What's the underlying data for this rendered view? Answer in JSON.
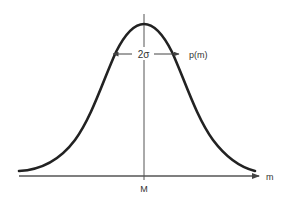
{
  "figure": {
    "labels": {
      "curve": "p(m)",
      "width": "2σ",
      "mean": "M",
      "x_axis": "m"
    },
    "colors": {
      "curve": "#222222",
      "axis": "#555555",
      "text": "#333333",
      "background": "#ffffff"
    }
  }
}
